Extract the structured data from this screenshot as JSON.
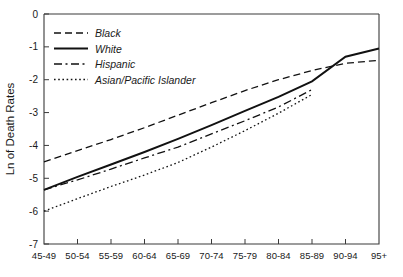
{
  "chart_data": {
    "type": "line",
    "title": "",
    "xlabel": "",
    "ylabel": "Ln of Death Rates",
    "categories": [
      "45-49",
      "50-54",
      "55-59",
      "60-64",
      "65-69",
      "70-74",
      "75-79",
      "80-84",
      "85-89",
      "90-94",
      "95+"
    ],
    "ylim": [
      -7,
      0
    ],
    "ytick_labels": [
      "0",
      "-1",
      "-2",
      "-3",
      "-4",
      "-5",
      "-6",
      "-7"
    ],
    "ytick_values": [
      0,
      -1,
      -2,
      -3,
      -4,
      -5,
      -6,
      -7
    ],
    "grid": false,
    "legend_position": "upper-left",
    "series": [
      {
        "name": "Black",
        "style": "dashed",
        "values": [
          -4.5,
          -4.16,
          -3.82,
          -3.46,
          -3.08,
          -2.7,
          -2.33,
          -2.0,
          -1.72,
          -1.5,
          -1.41
        ]
      },
      {
        "name": "White",
        "style": "solid",
        "values": [
          -5.35,
          -4.96,
          -4.58,
          -4.2,
          -3.8,
          -3.38,
          -2.95,
          -2.52,
          -2.05,
          -1.3,
          -1.05
        ]
      },
      {
        "name": "Hispanic",
        "style": "dash-dot",
        "values": [
          -5.35,
          -5.05,
          -4.72,
          -4.38,
          -4.05,
          -3.65,
          -3.25,
          -2.83,
          -2.3,
          null,
          null
        ]
      },
      {
        "name": "Asian/Pacific Islander",
        "style": "dotted",
        "values": [
          -6.0,
          -5.62,
          -5.25,
          -4.9,
          -4.52,
          -4.05,
          -3.55,
          -3.02,
          -2.45,
          null,
          null
        ]
      }
    ]
  },
  "legend": {
    "entries": [
      {
        "label": "Black"
      },
      {
        "label": "White"
      },
      {
        "label": "Hispanic"
      },
      {
        "label": "Asian/Pacific Islander"
      }
    ]
  }
}
